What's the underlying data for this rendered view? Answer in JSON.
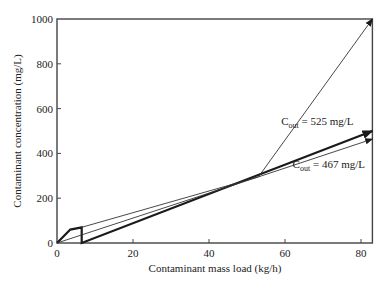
{
  "chart_data": {
    "type": "line",
    "title": "",
    "xlabel": "Contaminant mass load (kg/h)",
    "ylabel": "Contaminant concentration (mg/L)",
    "xlim": [
      0,
      83
    ],
    "ylim": [
      0,
      1000
    ],
    "xticks": [
      0,
      20,
      40,
      60,
      80
    ],
    "yticks": [
      0,
      200,
      400,
      600,
      800,
      1000
    ],
    "grid": false,
    "legend": null,
    "series": [
      {
        "name": "Limiting composite curve (thick)",
        "style": "thick",
        "points": [
          [
            0,
            0
          ],
          [
            3.5,
            60
          ],
          [
            6.5,
            70
          ],
          [
            6.5,
            0
          ],
          [
            83,
            500
          ]
        ],
        "arrow_end": true
      },
      {
        "name": "Water supply line from origin (thin)",
        "style": "thin",
        "points": [
          [
            0,
            0
          ],
          [
            53,
            295
          ],
          [
            83,
            464
          ]
        ],
        "arrow_end": true
      },
      {
        "name": "Water supply line from (6.5,70) (thin)",
        "style": "thin",
        "points": [
          [
            6.5,
            70
          ],
          [
            53,
            295
          ]
        ],
        "arrow_end": false
      },
      {
        "name": "Steep outlet line (thin)",
        "style": "thin",
        "points": [
          [
            53,
            295
          ],
          [
            83,
            1000
          ]
        ],
        "arrow_end": true
      }
    ],
    "annotations": [
      {
        "text_main": "C",
        "text_sub": "out",
        "text_rest": " = 525 mg/L",
        "x": 59,
        "y": 525
      },
      {
        "text_main": "C",
        "text_sub": "out",
        "text_rest": " = 467 mg/L",
        "x": 62,
        "y": 335
      }
    ]
  },
  "colors": {
    "axis": "#444444",
    "line": "#1a1a1a",
    "thin_line": "#333333",
    "background": "#ffffff"
  }
}
